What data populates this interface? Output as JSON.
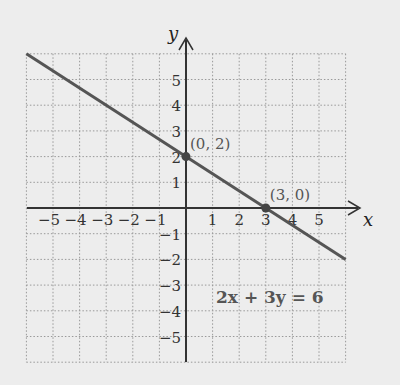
{
  "chart_data": {
    "type": "line",
    "title": "",
    "xlabel": "x",
    "ylabel": "y",
    "xlim": [
      -6,
      6
    ],
    "ylim": [
      -6,
      6
    ],
    "grid": true,
    "x_ticks": [
      "−5",
      "−4",
      "−3",
      "−2",
      "−1",
      "1",
      "2",
      "3",
      "4",
      "5"
    ],
    "y_ticks": [
      "5",
      "4",
      "3",
      "2",
      "1",
      "−1",
      "−2",
      "−3",
      "−4",
      "−5"
    ],
    "series": [
      {
        "name": "2x + 3y = 6",
        "x": [
          -6,
          6
        ],
        "y": [
          6,
          -2
        ]
      }
    ],
    "points": [
      {
        "x": 0,
        "y": 2,
        "label": "(0, 2)"
      },
      {
        "x": 3,
        "y": 0,
        "label": "(3, 0)"
      }
    ],
    "annotation": "2x + 3y = 6"
  }
}
